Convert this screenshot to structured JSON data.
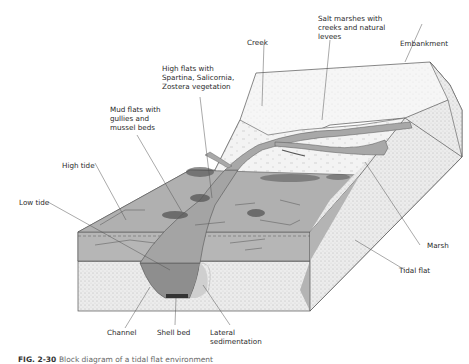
{
  "figure": {
    "caption_number": "FIG. 2-30",
    "caption_text": "Block diagram of a tidal flat environment"
  },
  "labels": {
    "salt_marshes": "Salt marshes with\ncreeks and natural\nlevees",
    "creek": "Creek",
    "embankment": "Embankment",
    "high_flats": "High flats with\nSpartina, Salicornia,\nZostera vegetation",
    "mud_flats": "Mud flats with\ngullies and\nmussel beds",
    "high_tide": "High tide",
    "low_tide": "Low tide",
    "marsh": "Marsh",
    "tidal_flat": "Tidal flat",
    "channel": "Channel",
    "shell_bed": "Shell bed",
    "lateral_sedimentation": "Lateral\nsedimentation"
  },
  "colors": {
    "tidal_flat_gray": "#b4b4b4",
    "channel_dark": "#8a8a8a",
    "marsh_light": "#f2f2f2",
    "stipple_side": "#e6e6e6",
    "outline": "#555555",
    "creek_fill": "#a8a8a8"
  }
}
